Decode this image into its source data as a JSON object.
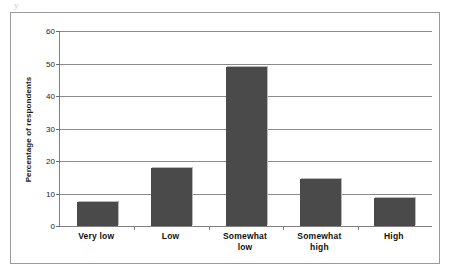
{
  "artifact": {
    "mark": "y"
  },
  "chart_data": {
    "type": "bar",
    "title": "",
    "subtitle": "",
    "xlabel": "",
    "ylabel": "Percentage of respondents",
    "categories": [
      "Very low",
      "Low",
      "Somewhat low",
      "Somewhat high",
      "High"
    ],
    "category_lines": [
      [
        "Very low"
      ],
      [
        "Low"
      ],
      [
        "Somewhat",
        "low"
      ],
      [
        "Somewhat",
        "high"
      ],
      [
        "High"
      ]
    ],
    "values": [
      7.5,
      18,
      49,
      14.5,
      8.5
    ],
    "ylim": [
      0,
      60
    ],
    "ytick_values": [
      0,
      10,
      20,
      30,
      40,
      50,
      60
    ],
    "ytick_labels": [
      "0",
      "10",
      "20",
      "30",
      "40",
      "50",
      "60"
    ],
    "grid": "horizontal",
    "legend": "none",
    "bar_color": "#4a4a4a",
    "grid_color": "#8a8a8a",
    "axis_color": "#808080",
    "frame_color": "#9a9a9a",
    "text_color": "#111111"
  }
}
